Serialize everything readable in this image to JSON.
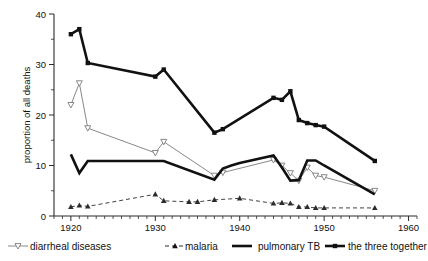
{
  "chart_data": {
    "type": "line",
    "title": "",
    "xlabel": "",
    "ylabel": "proportion of all deaths",
    "xlim": [
      1918,
      1961
    ],
    "ylim": [
      0,
      40
    ],
    "xticks": [
      1920,
      1930,
      1940,
      1950,
      1960
    ],
    "yticks": [
      0,
      10,
      20,
      30,
      40
    ],
    "xtick_labels": [
      "1920",
      "1930",
      "1940",
      "1950",
      "1960"
    ],
    "ytick_labels": [
      "0",
      "10",
      "20",
      "30",
      "40"
    ],
    "minor_tick_step": 1,
    "grid": false,
    "legend_position": "bottom",
    "series": [
      {
        "name": "diarrheal diseases",
        "style": "thin-solid",
        "marker": "open-triangle-down",
        "color": "#7a7a7a",
        "x": [
          1920,
          1921,
          1922,
          1930,
          1931,
          1937,
          1938,
          1944,
          1945,
          1946,
          1947,
          1948,
          1949,
          1950,
          1956
        ],
        "y": [
          22.0,
          26.3,
          17.4,
          12.5,
          14.7,
          8.0,
          8.6,
          11.1,
          10.0,
          8.5,
          7.0,
          9.6,
          8.0,
          7.7,
          5.0
        ]
      },
      {
        "name": "malaria",
        "style": "dashed",
        "marker": "filled-triangle-up",
        "color": "#2b2b2b",
        "x": [
          1920,
          1921,
          1922,
          1930,
          1931,
          1934,
          1935,
          1937,
          1940,
          1944,
          1945,
          1946,
          1947,
          1948,
          1949,
          1950,
          1956
        ],
        "y": [
          1.8,
          2.1,
          1.9,
          4.3,
          3.0,
          2.8,
          2.8,
          3.2,
          3.5,
          2.5,
          2.6,
          2.5,
          1.8,
          1.8,
          1.6,
          1.6,
          1.6
        ]
      },
      {
        "name": "pulmonary TB",
        "style": "thick-solid",
        "marker": "none",
        "color": "#111111",
        "x": [
          1920,
          1921,
          1922,
          1930,
          1931,
          1937,
          1938,
          1939,
          1940,
          1944,
          1945,
          1946,
          1947,
          1948,
          1949,
          1950,
          1956
        ],
        "y": [
          12.2,
          8.5,
          10.9,
          10.9,
          10.9,
          7.2,
          9.4,
          10.0,
          10.5,
          12.0,
          9.6,
          7.0,
          7.1,
          11.0,
          11.0,
          10.0,
          4.3
        ]
      },
      {
        "name": "the three together",
        "style": "thick-solid",
        "marker": "filled-square",
        "color": "#111111",
        "x": [
          1920,
          1921,
          1922,
          1930,
          1931,
          1937,
          1938,
          1944,
          1945,
          1946,
          1947,
          1948,
          1949,
          1950,
          1956
        ],
        "y": [
          36.0,
          37.0,
          30.3,
          27.6,
          29.0,
          16.5,
          17.2,
          23.4,
          23.0,
          24.7,
          19.0,
          18.4,
          18.0,
          17.7,
          10.9
        ]
      }
    ],
    "legend": [
      {
        "label": "diarrheal diseases",
        "marker": "open-triangle-down",
        "style": "thin-solid"
      },
      {
        "label": "malaria",
        "marker": "filled-triangle-up",
        "style": "dashed"
      },
      {
        "label": "pulmonary TB",
        "marker": "none",
        "style": "thick-solid"
      },
      {
        "label": "the three together",
        "marker": "filled-square",
        "style": "thick-solid"
      }
    ]
  },
  "colors": {
    "axis": "#2b2b2b",
    "thin_series": "#7a7a7a",
    "thick_series": "#111111",
    "background": "#ffffff"
  }
}
